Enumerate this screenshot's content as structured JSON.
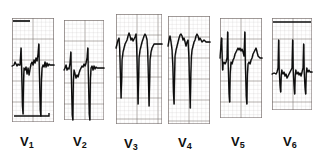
{
  "figure": {
    "kind": "ecg-strip",
    "background_color": "#ffffff",
    "trace_color": "#0d0d0d",
    "grid_minor_color": "#b9b0ae",
    "grid_major_color": "#6f6765",
    "width": 317,
    "height": 159
  },
  "chart_data": {
    "type": "line",
    "title": "",
    "xlabel": "",
    "ylabel": "",
    "grid": true,
    "legend_position": "bottom",
    "paper_speed": "25 mm/s",
    "panels": [
      {
        "label": "V",
        "subscript": "1",
        "label_text": "V1",
        "x": 12,
        "y": 18,
        "w": 42,
        "h": 104,
        "baseline_y": 46,
        "minor_grid_px": 4.2,
        "major_grid_px": 21,
        "beats": 2,
        "morphology": "rS with deep S wave, low R",
        "points": [
          [
            0,
            48
          ],
          [
            2,
            47
          ],
          [
            3,
            44
          ],
          [
            5,
            48
          ],
          [
            6,
            46
          ],
          [
            7,
            47
          ],
          [
            8,
            47
          ],
          [
            9,
            30
          ],
          [
            9.6,
            52
          ],
          [
            10.4,
            88
          ],
          [
            11,
            96
          ],
          [
            11.6,
            60
          ],
          [
            12,
            50
          ],
          [
            13,
            52
          ],
          [
            14,
            49
          ],
          [
            15,
            56
          ],
          [
            16,
            50
          ],
          [
            17,
            57
          ],
          [
            18,
            51
          ],
          [
            19,
            46
          ],
          [
            20,
            44
          ],
          [
            21,
            47
          ],
          [
            22,
            42
          ],
          [
            23,
            45
          ],
          [
            24,
            40
          ],
          [
            25,
            43
          ],
          [
            26,
            36
          ],
          [
            26.8,
            26
          ],
          [
            27.4,
            56
          ],
          [
            28.2,
            92
          ],
          [
            28.8,
            98
          ],
          [
            29.4,
            62
          ],
          [
            30,
            50
          ],
          [
            31,
            47
          ],
          [
            32,
            49
          ],
          [
            33,
            44
          ],
          [
            34,
            49
          ],
          [
            35,
            45
          ],
          [
            36,
            48
          ],
          [
            37,
            46
          ],
          [
            38,
            47
          ],
          [
            40,
            47
          ],
          [
            42,
            47
          ]
        ],
        "top_band": {
          "x1": 13,
          "x2": 30,
          "y": 21,
          "note": "dark horizontal artifact band"
        },
        "bottom_hook": {
          "note": "dark baseline hook at lower right"
        }
      },
      {
        "label": "V",
        "subscript": "2",
        "label_text": "V2",
        "x": 64,
        "y": 20,
        "w": 40,
        "h": 100,
        "baseline_y": 48,
        "minor_grid_px": 4.2,
        "major_grid_px": 21,
        "beats": 2,
        "morphology": "rS, very deep S extending below grid",
        "points": [
          [
            0,
            50
          ],
          [
            1,
            48
          ],
          [
            2,
            45
          ],
          [
            3,
            50
          ],
          [
            4,
            48
          ],
          [
            5,
            49
          ],
          [
            6,
            43
          ],
          [
            6.8,
            32
          ],
          [
            7.4,
            60
          ],
          [
            8.2,
            95
          ],
          [
            8.8,
            100
          ],
          [
            9.4,
            60
          ],
          [
            10,
            50
          ],
          [
            11,
            54
          ],
          [
            12,
            58
          ],
          [
            13,
            55
          ],
          [
            14,
            57
          ],
          [
            15,
            53
          ],
          [
            16,
            50
          ],
          [
            17,
            48
          ],
          [
            18,
            46
          ],
          [
            19,
            47
          ],
          [
            20,
            44
          ],
          [
            21,
            46
          ],
          [
            22,
            43
          ],
          [
            23,
            38
          ],
          [
            23.8,
            28
          ],
          [
            24.4,
            58
          ],
          [
            25.2,
            94
          ],
          [
            25.8,
            100
          ],
          [
            26.4,
            58
          ],
          [
            27,
            48
          ],
          [
            28,
            46
          ],
          [
            29,
            50
          ],
          [
            30,
            46
          ],
          [
            31,
            49
          ],
          [
            32,
            47
          ],
          [
            33,
            48
          ],
          [
            35,
            48
          ],
          [
            38,
            48
          ],
          [
            40,
            48
          ]
        ],
        "s_wave_overflow": true
      },
      {
        "label": "V",
        "subscript": "3",
        "label_text": "V3",
        "x": 116,
        "y": 14,
        "w": 46,
        "h": 110,
        "baseline_y": 30,
        "minor_grid_px": 4.2,
        "major_grid_px": 21,
        "beats": 2,
        "morphology": "tall R with very deep S, S extends far below grid",
        "points": [
          [
            0,
            34
          ],
          [
            1,
            30
          ],
          [
            2,
            26
          ],
          [
            3,
            24
          ],
          [
            3.6,
            34
          ],
          [
            4.4,
            60
          ],
          [
            5,
            84
          ],
          [
            5.6,
            66
          ],
          [
            6,
            46
          ],
          [
            7,
            38
          ],
          [
            8,
            34
          ],
          [
            9,
            30
          ],
          [
            10,
            28
          ],
          [
            11,
            26
          ],
          [
            12,
            22
          ],
          [
            13,
            19
          ],
          [
            14,
            22
          ],
          [
            15,
            26
          ],
          [
            16,
            24
          ],
          [
            17,
            27
          ],
          [
            18,
            25
          ],
          [
            19,
            23
          ],
          [
            20,
            20
          ],
          [
            20.6,
            32
          ],
          [
            21.4,
            62
          ],
          [
            22,
            90
          ],
          [
            22.6,
            64
          ],
          [
            23,
            44
          ],
          [
            24,
            36
          ],
          [
            25,
            32
          ],
          [
            26,
            28
          ],
          [
            27,
            25
          ],
          [
            28,
            22
          ],
          [
            29,
            20
          ],
          [
            30,
            22
          ],
          [
            31,
            26
          ],
          [
            31.6,
            36
          ],
          [
            32.4,
            64
          ],
          [
            33,
            92
          ],
          [
            33.6,
            66
          ],
          [
            34,
            46
          ],
          [
            35,
            38
          ],
          [
            36,
            34
          ],
          [
            37,
            32
          ],
          [
            38,
            30
          ],
          [
            40,
            30
          ],
          [
            43,
            30
          ],
          [
            46,
            30
          ]
        ],
        "s_wave_overflow": true,
        "overflow_depth_px": 40
      },
      {
        "label": "V",
        "subscript": "4",
        "label_text": "V4",
        "x": 168,
        "y": 16,
        "w": 42,
        "h": 108,
        "baseline_y": 30,
        "minor_grid_px": 4.2,
        "major_grid_px": 21,
        "beats": 2,
        "morphology": "tall R with deep S wave below grid",
        "points": [
          [
            0,
            30
          ],
          [
            1,
            24
          ],
          [
            2,
            20
          ],
          [
            3,
            26
          ],
          [
            4,
            34
          ],
          [
            4.8,
            50
          ],
          [
            5.4,
            76
          ],
          [
            6,
            88
          ],
          [
            6.6,
            56
          ],
          [
            7,
            40
          ],
          [
            8,
            34
          ],
          [
            9,
            30
          ],
          [
            10,
            26
          ],
          [
            11,
            22
          ],
          [
            12,
            19
          ],
          [
            13,
            18
          ],
          [
            14,
            20
          ],
          [
            15,
            24
          ],
          [
            16,
            22
          ],
          [
            17,
            26
          ],
          [
            18,
            30
          ],
          [
            19,
            26
          ],
          [
            20,
            24
          ],
          [
            20.8,
            40
          ],
          [
            21.6,
            70
          ],
          [
            22.2,
            92
          ],
          [
            22.8,
            58
          ],
          [
            23.4,
            40
          ],
          [
            24,
            34
          ],
          [
            25,
            30
          ],
          [
            26,
            26
          ],
          [
            27,
            24
          ],
          [
            28,
            20
          ],
          [
            29,
            18
          ],
          [
            30,
            20
          ],
          [
            31,
            24
          ],
          [
            32,
            22
          ],
          [
            34,
            26
          ],
          [
            36,
            24
          ],
          [
            38,
            26
          ],
          [
            40,
            26
          ],
          [
            42,
            26
          ]
        ],
        "s_wave_overflow": true
      },
      {
        "label": "V",
        "subscript": "5",
        "label_text": "V5",
        "x": 220,
        "y": 18,
        "w": 42,
        "h": 100,
        "baseline_y": 46,
        "minor_grid_px": 4.2,
        "major_grid_px": 21,
        "beats": 3,
        "morphology": "tall R spikes reaching top, deep S waves",
        "points": [
          [
            0,
            40
          ],
          [
            1,
            26
          ],
          [
            1.6,
            20
          ],
          [
            2,
            34
          ],
          [
            2.6,
            52
          ],
          [
            3,
            46
          ],
          [
            4,
            44
          ],
          [
            5,
            46
          ],
          [
            6,
            44
          ],
          [
            7,
            40
          ],
          [
            7.6,
            14
          ],
          [
            8.2,
            46
          ],
          [
            9,
            76
          ],
          [
            9.6,
            84
          ],
          [
            10.2,
            56
          ],
          [
            10.8,
            46
          ],
          [
            11,
            44
          ],
          [
            12,
            46
          ],
          [
            13,
            42
          ],
          [
            14,
            40
          ],
          [
            15,
            36
          ],
          [
            16,
            34
          ],
          [
            17,
            32
          ],
          [
            18,
            30
          ],
          [
            19,
            32
          ],
          [
            20,
            30
          ],
          [
            21,
            33
          ],
          [
            22,
            31
          ],
          [
            23,
            34
          ],
          [
            24,
            38
          ],
          [
            24.8,
            14
          ],
          [
            25.4,
            48
          ],
          [
            26.2,
            78
          ],
          [
            26.8,
            86
          ],
          [
            27.4,
            56
          ],
          [
            28,
            46
          ],
          [
            29,
            44
          ],
          [
            30,
            46
          ],
          [
            31,
            42
          ],
          [
            32,
            40
          ],
          [
            33,
            36
          ],
          [
            34,
            34
          ],
          [
            35,
            32
          ],
          [
            36,
            30
          ],
          [
            37,
            34
          ],
          [
            38,
            38
          ],
          [
            40,
            40
          ],
          [
            42,
            40
          ]
        ],
        "s_wave_overflow": true
      },
      {
        "label": "V",
        "subscript": "6",
        "label_text": "V6",
        "x": 272,
        "y": 18,
        "w": 40,
        "h": 92,
        "baseline_y": 54,
        "minor_grid_px": 4.2,
        "major_grid_px": 21,
        "beats": 3,
        "morphology": "QS complexes with deep narrow S waves, flat top artifact line",
        "points": [
          [
            0,
            56
          ],
          [
            2,
            55
          ],
          [
            4,
            56
          ],
          [
            5,
            54
          ],
          [
            6,
            50
          ],
          [
            6.6,
            22
          ],
          [
            7.2,
            52
          ],
          [
            8,
            68
          ],
          [
            8.6,
            74
          ],
          [
            9.2,
            58
          ],
          [
            9.8,
            52
          ],
          [
            10,
            54
          ],
          [
            11,
            56
          ],
          [
            12,
            54
          ],
          [
            13,
            58
          ],
          [
            14,
            56
          ],
          [
            15,
            60
          ],
          [
            16,
            58
          ],
          [
            17,
            56
          ],
          [
            18,
            54
          ],
          [
            19,
            52
          ],
          [
            20,
            50
          ],
          [
            20.6,
            22
          ],
          [
            21.2,
            52
          ],
          [
            22,
            68
          ],
          [
            22.6,
            76
          ],
          [
            23.2,
            58
          ],
          [
            23.8,
            52
          ],
          [
            24,
            54
          ],
          [
            25,
            56
          ],
          [
            26,
            54
          ],
          [
            27,
            57
          ],
          [
            28,
            55
          ],
          [
            29,
            58
          ],
          [
            30,
            54
          ],
          [
            31,
            50
          ],
          [
            31.6,
            26
          ],
          [
            32.2,
            54
          ],
          [
            33,
            70
          ],
          [
            33.6,
            76
          ],
          [
            34.2,
            56
          ],
          [
            34.8,
            50
          ],
          [
            35,
            52
          ],
          [
            36,
            54
          ],
          [
            37,
            52
          ],
          [
            38,
            54
          ],
          [
            40,
            54
          ]
        ],
        "top_band": {
          "x1": 273,
          "x2": 311,
          "y": 22,
          "note": "dark horizontal artifact line"
        }
      }
    ]
  },
  "labels": {
    "v1": {
      "base": "V",
      "sub": "1",
      "x": 20,
      "y": 134
    },
    "v2": {
      "base": "V",
      "sub": "2",
      "x": 73,
      "y": 134
    },
    "v3": {
      "base": "V",
      "sub": "3",
      "x": 124,
      "y": 136
    },
    "v4": {
      "base": "V",
      "sub": "4",
      "x": 178,
      "y": 135
    },
    "v5": {
      "base": "V",
      "sub": "5",
      "x": 231,
      "y": 134
    },
    "v6": {
      "base": "V",
      "sub": "6",
      "x": 283,
      "y": 134
    }
  }
}
